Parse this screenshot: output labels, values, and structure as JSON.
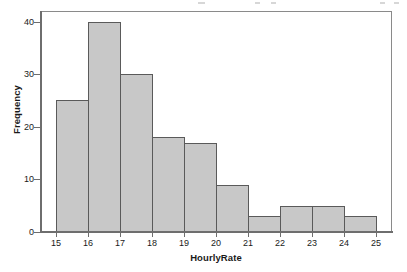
{
  "chart_data": {
    "type": "bar",
    "title": "",
    "subtitle": "",
    "xlabel": "HourlyRate",
    "ylabel": "Frequency",
    "categories": [
      "15-16",
      "16-17",
      "17-18",
      "18-19",
      "19-20",
      "20-21",
      "21-22",
      "22-23",
      "23-24",
      "24-25"
    ],
    "bin_edges": [
      15,
      16,
      17,
      18,
      19,
      20,
      21,
      22,
      23,
      24,
      25
    ],
    "values": [
      25,
      40,
      30,
      18,
      17,
      9,
      3,
      5,
      5,
      3
    ],
    "bin_width": 1,
    "xlim": [
      14.5,
      25.5
    ],
    "ylim": [
      0,
      42
    ],
    "x_ticks": [
      15,
      16,
      17,
      18,
      19,
      20,
      21,
      22,
      23,
      24,
      25
    ],
    "y_ticks": [
      0,
      10,
      20,
      30,
      40
    ],
    "grid": false,
    "legend": null,
    "legend_position": "none",
    "bar_fill_color": "#c8c8c8",
    "bar_edge_color": "#5a5a5a",
    "axis_color": "#6e6e6e",
    "frame_color": "#8a8a8a",
    "text_color": "#1a1a1a",
    "background_color": "#ffffff"
  }
}
